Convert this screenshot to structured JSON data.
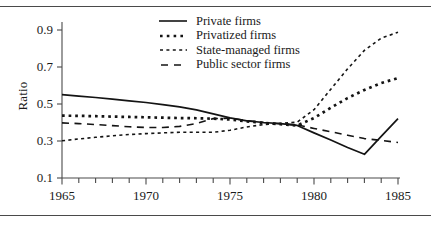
{
  "chart_data": {
    "type": "line",
    "title": "",
    "xlabel": "",
    "ylabel": "Ratio",
    "xlim": [
      1965,
      1985
    ],
    "ylim": [
      0.1,
      0.9
    ],
    "grid": false,
    "legend_position": "top-center",
    "x_ticks_major": [
      1965,
      1970,
      1975,
      1980,
      1985
    ],
    "x_tick_labels": [
      "1965",
      "1970",
      "1975",
      "1980",
      "1985"
    ],
    "x_ticks_minor_step": 1,
    "y_ticks": [
      0.1,
      0.3,
      0.5,
      0.7,
      0.9
    ],
    "y_tick_labels": [
      "0.1",
      "0.3",
      "0.5",
      "0.7",
      "0.9"
    ],
    "x": [
      1965,
      1966,
      1967,
      1968,
      1969,
      1970,
      1971,
      1972,
      1973,
      1974,
      1975,
      1976,
      1977,
      1978,
      1979,
      1980,
      1981,
      1982,
      1983,
      1984,
      1985
    ],
    "series": [
      {
        "name": "Private firms",
        "style": "solid",
        "color": "#141414",
        "values": [
          0.551,
          0.543,
          0.535,
          0.526,
          0.517,
          0.508,
          0.497,
          0.484,
          0.468,
          0.447,
          0.425,
          0.409,
          0.4,
          0.394,
          0.384,
          0.344,
          0.305,
          0.265,
          0.228,
          0.325,
          0.421
        ]
      },
      {
        "name": "Privatized firms",
        "style": "dotted-thick",
        "color": "#141414",
        "values": [
          0.437,
          0.436,
          0.434,
          0.432,
          0.43,
          0.428,
          0.426,
          0.424,
          0.423,
          0.421,
          0.416,
          0.406,
          0.398,
          0.391,
          0.384,
          0.424,
          0.48,
          0.532,
          0.576,
          0.613,
          0.64
        ]
      },
      {
        "name": "State-managed firms",
        "style": "dotted-fine",
        "color": "#141414",
        "values": [
          0.301,
          0.311,
          0.32,
          0.328,
          0.335,
          0.34,
          0.344,
          0.347,
          0.347,
          0.347,
          0.358,
          0.376,
          0.389,
          0.395,
          0.402,
          0.469,
          0.58,
          0.69,
          0.79,
          0.856,
          0.888
        ]
      },
      {
        "name": "Public sector firms",
        "style": "dashed-long",
        "color": "#141414",
        "values": [
          0.398,
          0.394,
          0.389,
          0.383,
          0.377,
          0.373,
          0.373,
          0.379,
          0.394,
          0.421,
          0.423,
          0.41,
          0.4,
          0.393,
          0.387,
          0.368,
          0.35,
          0.331,
          0.313,
          0.303,
          0.292
        ]
      }
    ]
  },
  "legend": {
    "entries": [
      {
        "label": "Private firms",
        "icon": "solid-line-icon"
      },
      {
        "label": "Privatized firms",
        "icon": "thick-dotted-line-icon"
      },
      {
        "label": "State-managed firms",
        "icon": "fine-dotted-line-icon"
      },
      {
        "label": "Public  sector firms",
        "icon": "long-dashed-line-icon"
      }
    ]
  }
}
